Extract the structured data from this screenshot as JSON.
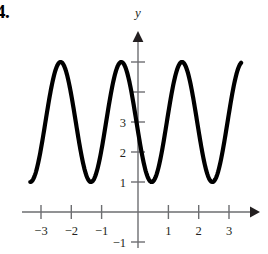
{
  "problem": {
    "number": "4."
  },
  "axes": {
    "y_axis_label": "y",
    "x_tick_labels": [
      "−3",
      "−2",
      "−1",
      "1",
      "2",
      "3"
    ],
    "y_tick_labels": [
      "3",
      "2",
      "1",
      "−1"
    ],
    "axis_color": "#6d6e71",
    "curve_color": "#000000"
  },
  "chart_data": {
    "type": "line",
    "title": "",
    "xlabel": "",
    "ylabel": "y",
    "xlim": [
      -3.6,
      3.8
    ],
    "ylim": [
      -1.45,
      5.9
    ],
    "grid": false,
    "legend": null,
    "x_ticks": [
      -3,
      -2,
      -1,
      1,
      2,
      3
    ],
    "y_ticks": [
      3,
      2,
      1,
      -1
    ],
    "y_ticks_unlabeled": [
      4,
      5
    ],
    "function": "y = 3 + 2*cos(pi*(x + 0.55))",
    "midline": 3,
    "amplitude": 2,
    "period": 2,
    "maximum": 5,
    "minimum": 1,
    "maxima_x": [
      -2.55,
      -0.55,
      1.45,
      3.45
    ],
    "minima_x": [
      -1.55,
      0.45,
      2.45
    ],
    "x_start": -3.55,
    "x_end": 3.4,
    "series": [
      {
        "name": "curve",
        "x": [
          -3.55,
          -3.4,
          -3.2,
          -3.0,
          -2.8,
          -2.55,
          -2.3,
          -2.1,
          -1.9,
          -1.7,
          -1.55,
          -1.4,
          -1.2,
          -1.0,
          -0.8,
          -0.55,
          -0.3,
          -0.1,
          0.1,
          0.3,
          0.45,
          0.6,
          0.8,
          1.0,
          1.2,
          1.45,
          1.7,
          1.9,
          2.1,
          2.3,
          2.45,
          2.6,
          2.8,
          3.0,
          3.2,
          3.4
        ],
        "y": [
          1.05,
          1.45,
          2.3,
          3.4,
          4.45,
          5.0,
          4.45,
          3.4,
          2.3,
          1.35,
          1.0,
          1.2,
          2.0,
          3.0,
          4.2,
          5.0,
          4.45,
          3.4,
          2.3,
          1.35,
          1.0,
          1.2,
          2.0,
          3.1,
          4.3,
          5.0,
          4.45,
          3.4,
          2.3,
          1.35,
          1.0,
          1.2,
          2.0,
          3.1,
          4.3,
          5.0
        ]
      }
    ]
  }
}
